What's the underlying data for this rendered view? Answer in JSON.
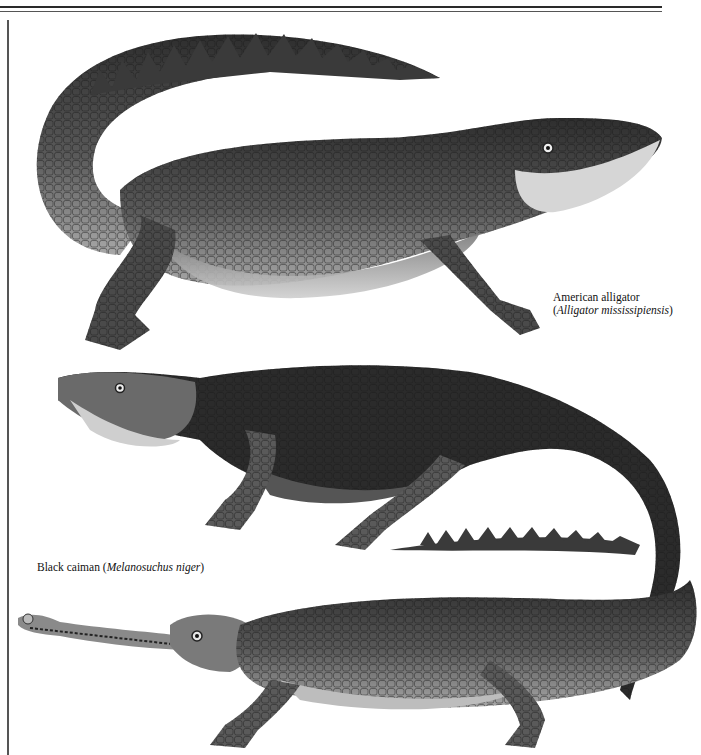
{
  "page": {
    "type": "book illustration plate",
    "subjects": [
      "American alligator",
      "Black caiman",
      "gharial-like crocodilian (unlabeled)"
    ]
  },
  "captions": {
    "alligator": {
      "common_name": "American alligator",
      "scientific_name_open": "(",
      "scientific_name": "Alligator mississipiensis",
      "scientific_name_close": ")"
    },
    "caiman": {
      "common_name": "Black caiman ",
      "scientific_name_open": "(",
      "scientific_name": "Melanosuchus niger",
      "scientific_name_close": ")"
    }
  },
  "colors": {
    "background": "#ffffff",
    "rules": "#2a2a2a",
    "animal_dark": "#2e2e2e",
    "animal_mid": "#6b6b6b",
    "animal_light": "#c9c9c9"
  }
}
